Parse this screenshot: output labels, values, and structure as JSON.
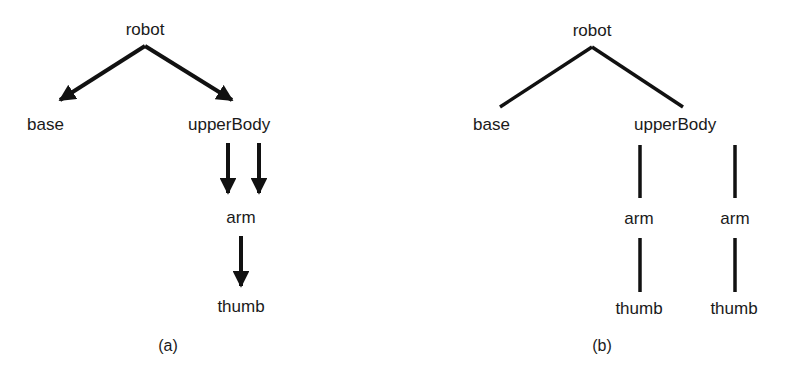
{
  "diagram_a": {
    "caption": "(a)",
    "description": "directed acyclic graph with shared arm node",
    "nodes": {
      "robot": "robot",
      "base": "base",
      "upperBody": "upperBody",
      "arm": "arm",
      "thumb": "thumb"
    },
    "edges": [
      {
        "from": "robot",
        "to": "base",
        "arrow": true
      },
      {
        "from": "robot",
        "to": "upperBody",
        "arrow": true
      },
      {
        "from": "upperBody",
        "to": "arm",
        "arrow": true
      },
      {
        "from": "upperBody",
        "to": "arm",
        "arrow": true
      },
      {
        "from": "arm",
        "to": "thumb",
        "arrow": true
      }
    ]
  },
  "diagram_b": {
    "caption": "(b)",
    "description": "tree with duplicated arm subtrees",
    "nodes": {
      "robot": "robot",
      "base": "base",
      "upperBody": "upperBody",
      "arm_left": "arm",
      "arm_right": "arm",
      "thumb_left": "thumb",
      "thumb_right": "thumb"
    },
    "edges": [
      {
        "from": "robot",
        "to": "base",
        "arrow": false
      },
      {
        "from": "robot",
        "to": "upperBody",
        "arrow": false
      },
      {
        "from": "upperBody",
        "to": "arm_left",
        "arrow": false
      },
      {
        "from": "upperBody",
        "to": "arm_right",
        "arrow": false
      },
      {
        "from": "arm_left",
        "to": "thumb_left",
        "arrow": false
      },
      {
        "from": "arm_right",
        "to": "thumb_right",
        "arrow": false
      }
    ]
  },
  "colors": {
    "ink": "#111111",
    "background": "#ffffff"
  }
}
